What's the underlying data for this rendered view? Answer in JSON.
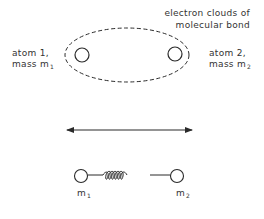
{
  "diagram": {
    "cloud_label": {
      "line1": "electron clouds of",
      "line2": "molecular bond"
    },
    "atom1": {
      "line1": "atom 1,",
      "mass_prefix": "mass m",
      "mass_sub": "1"
    },
    "atom2": {
      "line1": "atom 2,",
      "mass_prefix": "mass m",
      "mass_sub": "2"
    },
    "spring_model": {
      "left_mass": "m",
      "left_sub": "1",
      "right_mass": "m",
      "right_sub": "2"
    },
    "colors": {
      "stroke": "#2a2a2a",
      "text": "#333333",
      "background": "#ffffff"
    }
  }
}
